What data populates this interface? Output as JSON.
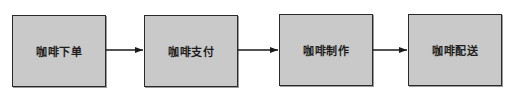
{
  "diagram": {
    "type": "flowchart",
    "direction": "left-to-right",
    "nodes": [
      {
        "id": "n1",
        "label": "咖啡下单"
      },
      {
        "id": "n2",
        "label": "咖啡支付"
      },
      {
        "id": "n3",
        "label": "咖啡制作"
      },
      {
        "id": "n4",
        "label": "咖啡配送"
      }
    ],
    "edges": [
      {
        "from": "n1",
        "to": "n2"
      },
      {
        "from": "n2",
        "to": "n3"
      },
      {
        "from": "n3",
        "to": "n4"
      }
    ],
    "colors": {
      "box_fill": "#c9c9c9",
      "box_border": "#2a2a2a",
      "arrow": "#1a1a1a"
    }
  }
}
